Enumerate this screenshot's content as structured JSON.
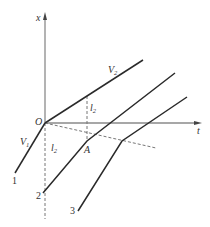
{
  "diagram": {
    "axes": {
      "vertical_label": "x",
      "horizontal_label": "t",
      "origin_label": "O"
    },
    "lines": {
      "v2": {
        "label": "V",
        "sub": "2"
      },
      "v1": {
        "label": "V",
        "sub": "1"
      },
      "line1": {
        "label": "1"
      },
      "line2": {
        "label": "2"
      },
      "line3": {
        "label": "3"
      }
    },
    "points": {
      "a": {
        "label": "A"
      }
    },
    "intervals": {
      "upper": {
        "label": "l",
        "sub": "2"
      },
      "lower": {
        "label": "l",
        "sub": "2"
      }
    },
    "colors": {
      "solid_line": "#2a2a2a",
      "axis": "#8a8a8a",
      "dashed": "#777777"
    }
  }
}
